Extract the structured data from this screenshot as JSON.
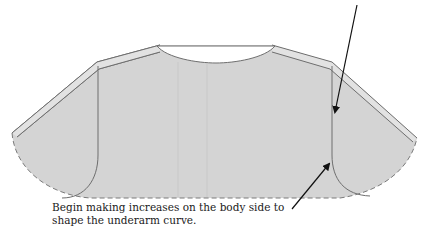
{
  "diagram": {
    "type": "knitting-schematic",
    "colors": {
      "fill": "#d4d4d4",
      "outline": "#6e6e6e",
      "band": "#e6e6e6",
      "arrow": "#111111",
      "neckline": "#ffffff"
    },
    "annotations": [
      {
        "id": "top-annotation",
        "text": "",
        "note": "label text cropped above image edge; only arrow visible"
      },
      {
        "id": "bottom-annotation",
        "lines": [
          "Begin making increases on the body side to",
          "shape the underarm curve."
        ]
      }
    ]
  }
}
